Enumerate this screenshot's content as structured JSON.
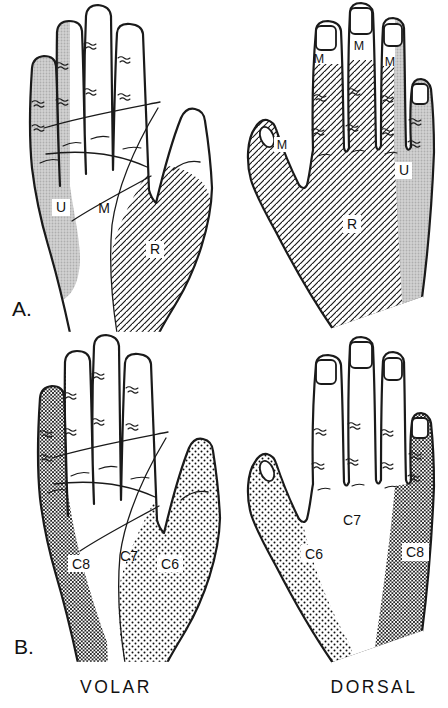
{
  "panel_a": {
    "label": "A.",
    "volar_hand": {
      "ulnar": "U",
      "median": "M",
      "radial": "R"
    },
    "dorsal_hand": {
      "median_thumb": "M",
      "median_index": "M",
      "median_middle": "M",
      "median_ring": "M",
      "ulnar": "U",
      "radial": "R"
    }
  },
  "panel_b": {
    "label": "B.",
    "volar_hand": {
      "c8": "C8",
      "c7": "C7",
      "c6": "C6"
    },
    "dorsal_hand": {
      "c6": "C6",
      "c7": "C7",
      "c8": "C8"
    }
  },
  "captions": {
    "volar": "VOLAR",
    "dorsal": "DORSAL"
  },
  "colors": {
    "ink": "#1a1a1a",
    "paper": "#ffffff",
    "ulnar_stipple_gray": "#cfcfcf"
  }
}
